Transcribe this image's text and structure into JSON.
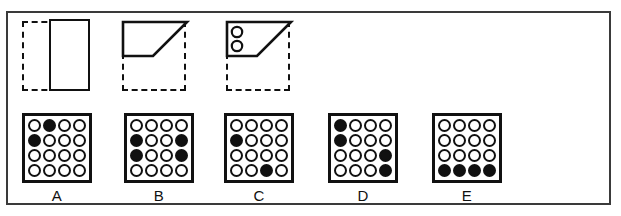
{
  "figure": {
    "title": "",
    "colors": {
      "ink": "#111111",
      "frame": "#3a3a3a",
      "paper": "#ffffff"
    }
  },
  "prompt": {
    "name": "stimulus-sequence",
    "items": [
      {
        "id": "stimulus-1",
        "shape": "rectangle",
        "description": "dashed square with solid tall rectangle on right side",
        "dots": 0
      },
      {
        "id": "stimulus-2",
        "shape": "trapezoid",
        "description": "dashed square with solid trapezoid in upper half, diagonal rising to top right",
        "dots": 0
      },
      {
        "id": "stimulus-3",
        "shape": "trapezoid-with-dots",
        "description": "dashed square with solid trapezoid in upper half containing two small circles on the left",
        "dots": 2
      }
    ]
  },
  "options": {
    "name": "answer-options",
    "rows": 4,
    "cols": 4,
    "items": [
      {
        "label": "A",
        "filled_count": 2,
        "cells": [
          [
            0,
            1,
            0,
            0
          ],
          [
            1,
            0,
            0,
            0
          ],
          [
            0,
            0,
            0,
            0
          ],
          [
            0,
            0,
            0,
            0
          ]
        ]
      },
      {
        "label": "B",
        "filled_count": 4,
        "cells": [
          [
            0,
            0,
            0,
            0
          ],
          [
            1,
            0,
            0,
            1
          ],
          [
            1,
            0,
            0,
            1
          ],
          [
            0,
            0,
            0,
            0
          ]
        ]
      },
      {
        "label": "C",
        "filled_count": 2,
        "cells": [
          [
            0,
            0,
            0,
            0
          ],
          [
            1,
            0,
            0,
            0
          ],
          [
            0,
            0,
            0,
            0
          ],
          [
            0,
            0,
            1,
            0
          ]
        ]
      },
      {
        "label": "D",
        "filled_count": 4,
        "cells": [
          [
            1,
            0,
            0,
            0
          ],
          [
            1,
            0,
            0,
            0
          ],
          [
            0,
            0,
            0,
            1
          ],
          [
            0,
            0,
            0,
            1
          ]
        ]
      },
      {
        "label": "E",
        "filled_count": 4,
        "cells": [
          [
            0,
            0,
            0,
            0
          ],
          [
            0,
            0,
            0,
            0
          ],
          [
            0,
            0,
            0,
            0
          ],
          [
            1,
            1,
            1,
            1
          ]
        ]
      }
    ]
  }
}
